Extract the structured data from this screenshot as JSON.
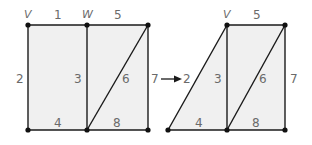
{
  "colors": {
    "edge": "#1a1a1a",
    "face": "#f0f0f0",
    "label": "#6a6a6a",
    "vertex": "#111111"
  },
  "left_graph": {
    "vertex_labels": {
      "v": "V",
      "w": "W"
    },
    "edge_labels": {
      "e1": "1",
      "e2": "2",
      "e3": "3",
      "e4": "4",
      "e5": "5",
      "e6": "6",
      "e7": "7",
      "e8": "8"
    }
  },
  "transition": {
    "from_label": "7",
    "to_label": "2",
    "arrow": "right-arrow"
  },
  "right_graph": {
    "vertex_labels": {
      "v": "V"
    },
    "edge_labels": {
      "e2": "2",
      "e3": "3",
      "e4": "4",
      "e5": "5",
      "e6": "6",
      "e7": "7",
      "e8": "8"
    }
  }
}
